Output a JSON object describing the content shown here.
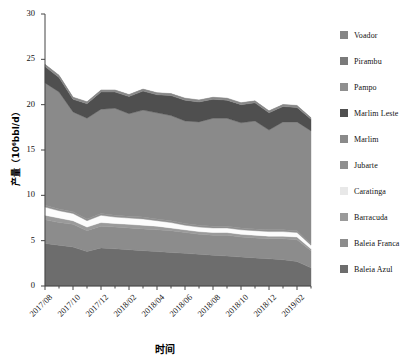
{
  "chart_data": {
    "type": "area",
    "stacked": true,
    "title": "",
    "xlabel": "时间",
    "ylabel": "产量（10⁶bbl/d）",
    "xlim": [
      0,
      19
    ],
    "ylim": [
      0,
      30
    ],
    "yticks": [
      0,
      5,
      10,
      15,
      20,
      25,
      30
    ],
    "grid": false,
    "legend_position": "right",
    "x": [
      "2017/08",
      "2017/09",
      "2017/10",
      "2017/11",
      "2017/12",
      "2018/01",
      "2018/02",
      "2018/03",
      "2018/04",
      "2018/05",
      "2018/06",
      "2018/07",
      "2018/08",
      "2018/09",
      "2018/10",
      "2018/11",
      "2018/12",
      "2019/01",
      "2019/02",
      "2019/03"
    ],
    "xtick_labels": [
      "2017/08",
      "2017/10",
      "2017/12",
      "2018/02",
      "2018/04",
      "2018/06",
      "2018/08",
      "2018/10",
      "2018/12",
      "2019/02"
    ],
    "xtick_indices": [
      0,
      2,
      4,
      6,
      8,
      10,
      12,
      14,
      16,
      18
    ],
    "series": [
      {
        "name": "Baleia Azul",
        "color": "#6d6d6d",
        "values": [
          4.7,
          4.5,
          4.3,
          3.8,
          4.2,
          4.1,
          4.0,
          3.9,
          3.8,
          3.7,
          3.6,
          3.5,
          3.4,
          3.3,
          3.2,
          3.1,
          3.0,
          2.9,
          2.7,
          2.0
        ]
      },
      {
        "name": "Baleia Franca",
        "color": "#8c8c8c",
        "values": [
          2.6,
          2.5,
          2.5,
          2.3,
          2.4,
          2.4,
          2.4,
          2.4,
          2.4,
          2.4,
          2.3,
          2.2,
          2.2,
          2.3,
          2.2,
          2.2,
          2.2,
          2.3,
          2.4,
          1.9
        ]
      },
      {
        "name": "Barracuda",
        "color": "#9a9a9a",
        "values": [
          0.5,
          0.5,
          0.4,
          0.4,
          0.4,
          0.4,
          0.4,
          0.4,
          0.4,
          0.3,
          0.3,
          0.3,
          0.3,
          0.3,
          0.3,
          0.3,
          0.3,
          0.3,
          0.3,
          0.2
        ]
      },
      {
        "name": "Caratinga",
        "color": "#fcfcfc",
        "values": [
          0.9,
          0.8,
          0.8,
          0.7,
          0.8,
          0.7,
          0.7,
          0.7,
          0.6,
          0.6,
          0.5,
          0.5,
          0.5,
          0.5,
          0.5,
          0.5,
          0.5,
          0.5,
          0.5,
          0.4
        ]
      },
      {
        "name": "Jubarte",
        "color": "#8f8f8f",
        "values": [
          0.2,
          0.2,
          0.2,
          0.2,
          0.2,
          0.2,
          0.2,
          0.2,
          0.2,
          0.2,
          0.2,
          0.2,
          0.2,
          0.2,
          0.2,
          0.2,
          0.2,
          0.2,
          0.2,
          0.1
        ]
      },
      {
        "name": "Marlim",
        "color": "#8a8a8a",
        "values": [
          13.5,
          12.9,
          11.0,
          11.1,
          11.5,
          11.8,
          11.3,
          11.8,
          11.7,
          11.6,
          11.3,
          11.4,
          11.9,
          11.9,
          11.6,
          11.9,
          11.0,
          11.9,
          12.0,
          12.5
        ]
      },
      {
        "name": "Marlim Leste",
        "color": "#4f4f4f",
        "values": [
          1.8,
          1.6,
          1.4,
          1.6,
          1.9,
          1.8,
          1.9,
          2.1,
          2.0,
          2.2,
          2.3,
          2.2,
          2.1,
          2.0,
          2.0,
          2.0,
          1.9,
          1.7,
          1.6,
          1.3
        ]
      },
      {
        "name": "Pampo",
        "color": "#8f8f8f",
        "values": [
          0.12,
          0.12,
          0.1,
          0.1,
          0.1,
          0.1,
          0.1,
          0.1,
          0.1,
          0.1,
          0.1,
          0.1,
          0.1,
          0.1,
          0.1,
          0.1,
          0.1,
          0.1,
          0.1,
          0.08
        ]
      },
      {
        "name": "Pirambu",
        "color": "#7a7a7a",
        "values": [
          0.08,
          0.08,
          0.08,
          0.07,
          0.07,
          0.07,
          0.07,
          0.07,
          0.07,
          0.07,
          0.07,
          0.07,
          0.07,
          0.07,
          0.07,
          0.07,
          0.07,
          0.07,
          0.07,
          0.05
        ]
      },
      {
        "name": "Voador",
        "color": "#858585",
        "values": [
          0.05,
          0.05,
          0.05,
          0.05,
          0.05,
          0.05,
          0.05,
          0.05,
          0.05,
          0.05,
          0.05,
          0.05,
          0.05,
          0.05,
          0.05,
          0.05,
          0.05,
          0.05,
          0.05,
          0.03
        ]
      }
    ]
  },
  "legend": {
    "items": [
      {
        "label": "Voador",
        "color": "#858585"
      },
      {
        "label": "Pirambu",
        "color": "#7a7a7a"
      },
      {
        "label": "Pampo",
        "color": "#8f8f8f"
      },
      {
        "label": "Marlim Leste",
        "color": "#4f4f4f"
      },
      {
        "label": "Marlim",
        "color": "#8a8a8a"
      },
      {
        "label": "Jubarte",
        "color": "#8f8f8f"
      },
      {
        "label": "Caratinga",
        "color": "#e8e8e8"
      },
      {
        "label": "Barracuda",
        "color": "#9a9a9a"
      },
      {
        "label": "Baleia Franca",
        "color": "#8c8c8c"
      },
      {
        "label": "Baleia Azul",
        "color": "#6d6d6d"
      }
    ]
  },
  "axes": {
    "x_title": "时间",
    "y_title": "产量（10⁶bbl/d）"
  }
}
